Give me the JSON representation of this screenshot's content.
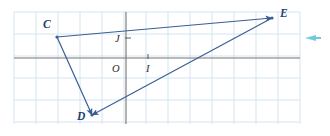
{
  "figure": {
    "canvas": {
      "width": 330,
      "height": 136
    },
    "background_color": "#ffffff"
  },
  "grid": {
    "color": "#cfe2ef",
    "spacing": 22,
    "x_start": 14,
    "y_start": 12,
    "x_end": 300,
    "y_end": 124,
    "visible": true
  },
  "axes": {
    "color": "#77746f",
    "x_axis": {
      "y": 58,
      "x_from": 14,
      "x_to": 300
    },
    "y_axis": {
      "x": 126,
      "y_from": 12,
      "y_to": 124
    },
    "origin_label": "O",
    "unit_x_label": "I",
    "unit_y_label": "J",
    "tick_color": "#4a4a4a"
  },
  "ticks": [
    {
      "name": "tick-j",
      "x": 126,
      "y": 38,
      "orientation": "horizontal"
    },
    {
      "name": "tick-i",
      "x": 148,
      "y": 58,
      "orientation": "vertical"
    }
  ],
  "shape": {
    "name": "triangle-cde",
    "stroke_color": "#3a5f96",
    "stroke_width": 1.2,
    "vertices": [
      {
        "label": "C",
        "x": 57,
        "y": 37,
        "label_x": 43,
        "label_y": 28
      },
      {
        "label": "D",
        "x": 92,
        "y": 115,
        "label_x": 77,
        "label_y": 120
      },
      {
        "label": "E",
        "x": 272,
        "y": 18,
        "label_x": 280,
        "label_y": 17
      }
    ],
    "edges": [
      {
        "name": "edge-c-to-e",
        "from": "C",
        "to": "E",
        "arrow_at": "E"
      },
      {
        "name": "edge-e-to-d",
        "from": "E",
        "to": "D",
        "arrow_at": "D"
      },
      {
        "name": "edge-c-to-d",
        "from": "C",
        "to": "D",
        "arrow_at": "D"
      }
    ]
  },
  "axis_labels": [
    {
      "name": "label-j",
      "text": "J",
      "x": 115,
      "y": 42
    },
    {
      "name": "label-o",
      "text": "O",
      "x": 112,
      "y": 72
    },
    {
      "name": "label-i",
      "text": "I",
      "x": 146,
      "y": 72
    }
  ],
  "decoration": {
    "right_arrow": {
      "name": "right-edge-arrow",
      "color": "#59c0d8",
      "x": 305,
      "y": 35,
      "width": 16,
      "height": 6
    }
  }
}
